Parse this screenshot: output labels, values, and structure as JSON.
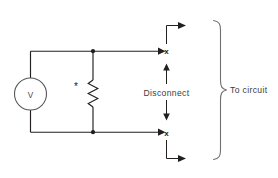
{
  "diagram": {
    "components": {
      "voltage_source": {
        "symbol_label": "V",
        "name": "voltmeter-source",
        "shape": "circle"
      },
      "resistor": {
        "marker": "*",
        "name": "resistor",
        "shape": "zigzag"
      }
    },
    "terminals": {
      "upper": "x",
      "lower": "x"
    },
    "labels": {
      "disconnect": "Disconnect",
      "to_circuit": "To circuit"
    },
    "colors": {
      "wire": "#231f20",
      "brace": "#6f6f70",
      "text": "#3b3b3d",
      "background": "#ffffff"
    }
  }
}
